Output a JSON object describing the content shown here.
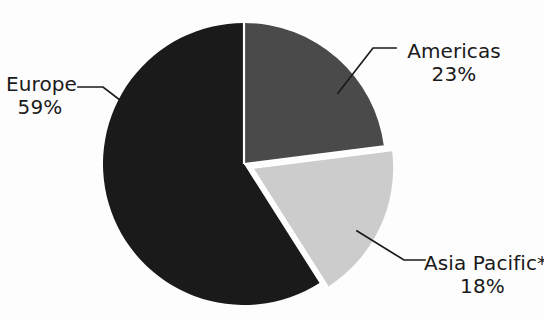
{
  "chart_data": {
    "type": "pie",
    "title": "",
    "subtitle": "",
    "xlabel": "",
    "ylabel": "",
    "legend_position": "none",
    "grid": false,
    "labels_inline": true,
    "units": "%",
    "categories": [
      "Europe",
      "Americas",
      "Asia Pacific*"
    ],
    "values": [
      59,
      23,
      18
    ],
    "slices": [
      {
        "name": "Europe",
        "label": "Europe",
        "value": 59,
        "value_label": "59%",
        "color": "#1a1a1a",
        "start_angle_deg": 147.6,
        "sweep_deg": 212.4,
        "exploded": false
      },
      {
        "name": "Americas",
        "label": "Americas",
        "value": 23,
        "value_label": "23%",
        "color": "#4a4a4a",
        "start_angle_deg": 0,
        "sweep_deg": 82.8,
        "exploded": false
      },
      {
        "name": "Asia Pacific",
        "label": "Asia Pacific*",
        "value": 18,
        "value_label": "18%",
        "color": "#cccccc",
        "start_angle_deg": 82.8,
        "sweep_deg": 64.8,
        "exploded": true
      }
    ]
  },
  "chart": {
    "background_color": "#fdfdfd",
    "separator_color": "#ffffff",
    "leader_line_color": "#1a1a1a",
    "text_color": "#1a1a1a",
    "center_x": 244,
    "center_y": 164,
    "radius": 141
  },
  "labels": {
    "europe": {
      "name": "Europe",
      "value": "59%"
    },
    "americas": {
      "name": "Americas",
      "value": "23%"
    },
    "asia_pacific": {
      "name": "Asia Pacific*",
      "value": "18%"
    }
  }
}
